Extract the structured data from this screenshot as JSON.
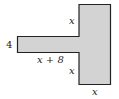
{
  "figure": {
    "shape": "T-shaped polygon (vertical rectangle with horizontal arm on left)",
    "fill_color": "#d3d3d3",
    "stroke_color": "#222222",
    "labels": {
      "arm_height": "4",
      "arm_length": "x + 8",
      "upper_left_edge": "x",
      "lower_left_edge": "x",
      "bottom_width": "x"
    }
  }
}
